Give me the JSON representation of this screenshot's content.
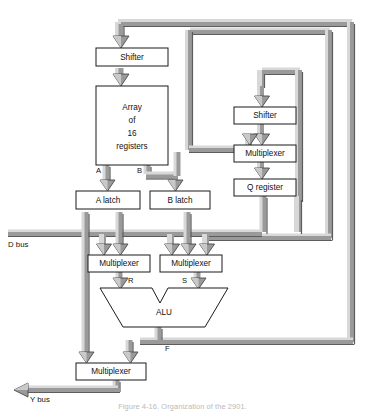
{
  "figure": {
    "caption": "Figure 4-16.  Organization of the 2901.",
    "colors": {
      "bus_face": "#9a9a9a",
      "bus_highlight": "#d8d8d8",
      "bus_shadow": "#5c5c5c",
      "box_stroke": "#1a1a1a",
      "box_fill": "#ffffff",
      "text": "#111111",
      "background": "#ffffff"
    }
  },
  "blocks": {
    "top_shifter": {
      "label": "Shifter"
    },
    "register_array": {
      "label_line1": "Array",
      "label_line2": "of",
      "label_line3": "16",
      "label_line4": "registers"
    },
    "a_latch": {
      "label": "A latch"
    },
    "b_latch": {
      "label": "B latch"
    },
    "left_multiplexer": {
      "label": "Multiplexer"
    },
    "right_multiplexer": {
      "label": "Multiplexer"
    },
    "alu": {
      "label": "ALU"
    },
    "output_multiplexer": {
      "label": "Multiplexer"
    },
    "q_shifter": {
      "label": "Shifter"
    },
    "q_multiplexer": {
      "label": "Multiplexer"
    },
    "q_register": {
      "label": "Q register"
    }
  },
  "signals": {
    "a_port": "A",
    "b_port": "B",
    "r_input": "R",
    "s_input": "S",
    "f_output": "F"
  },
  "buses": {
    "d_bus": "D bus",
    "y_bus": "Y bus"
  }
}
